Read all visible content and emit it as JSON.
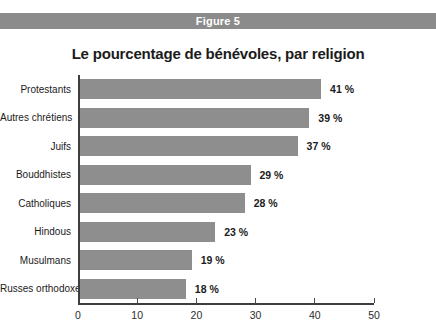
{
  "figure": {
    "label": "Figure 5"
  },
  "chart_data": {
    "type": "bar",
    "orientation": "horizontal",
    "title": "Le pourcentage de bénévoles, par religion",
    "categories": [
      "Protestants",
      "Autres chrétiens",
      "Juifs",
      "Bouddhistes",
      "Catholiques",
      "Hindous",
      "Musulmans",
      "Russes orthodoxes"
    ],
    "values": [
      41,
      39,
      37,
      29,
      28,
      23,
      19,
      18
    ],
    "value_labels": [
      "41 %",
      "39 %",
      "37 %",
      "29 %",
      "28 %",
      "23 %",
      "19 %",
      "18 %"
    ],
    "xlabel": "",
    "ylabel": "",
    "xlim": [
      0,
      50
    ],
    "x_ticks": [
      0,
      10,
      20,
      30,
      40,
      50
    ],
    "grid": false,
    "legend": "none"
  },
  "colors": {
    "header_bar_bg": "#8b8b8b",
    "header_bar_text": "#ffffff",
    "bar_fill": "#8e8e8e",
    "axis_line": "#3e3e3e",
    "text": "#1b1b1b"
  }
}
